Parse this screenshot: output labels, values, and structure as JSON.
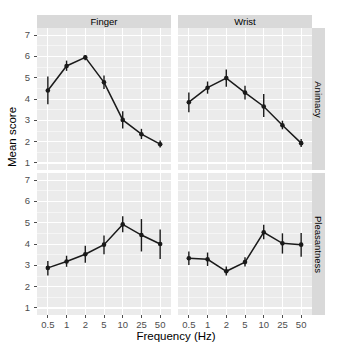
{
  "chart_data": {
    "type": "line",
    "title": "",
    "xlabel": "Frequency (Hz)",
    "ylabel": "Mean score",
    "ylim": [
      1,
      7
    ],
    "yticks": [
      1,
      2,
      3,
      4,
      5,
      6,
      7
    ],
    "x": [
      0.5,
      1,
      2,
      5,
      10,
      25,
      50
    ],
    "xtick_labels": [
      "0.5",
      "1",
      "2",
      "5",
      "10",
      "25",
      "50"
    ],
    "xscale": "log (evenly spaced categories)",
    "grid": true,
    "legend": "none",
    "facet_col_labels": [
      "Finger",
      "Wrist"
    ],
    "facet_row_labels": [
      "Animacy",
      "Pleasantness"
    ],
    "errorbars": "vertical, symmetric (95% CI)",
    "marker": "filled circle",
    "line_color": "#1a1a1a",
    "panel_bg": "#ebebeb",
    "strip_bg": "#d9d9d9",
    "grid_color": "#ffffff",
    "panels": [
      {
        "col": "Finger",
        "row": "Animacy",
        "values": [
          4.4,
          5.55,
          5.95,
          4.78,
          3.02,
          2.35,
          1.88
        ],
        "err_low": [
          3.75,
          5.32,
          5.82,
          4.47,
          2.62,
          2.12,
          1.72
        ],
        "err_high": [
          5.05,
          5.8,
          6.06,
          5.1,
          3.42,
          2.6,
          2.05
        ]
      },
      {
        "col": "Wrist",
        "row": "Animacy",
        "values": [
          3.85,
          4.53,
          4.98,
          4.3,
          3.65,
          2.77,
          1.93
        ],
        "err_low": [
          3.38,
          4.25,
          4.58,
          3.98,
          3.15,
          2.58,
          1.75
        ],
        "err_high": [
          4.3,
          4.82,
          5.38,
          4.62,
          4.23,
          2.98,
          2.12
        ]
      },
      {
        "col": "Finger",
        "row": "Pleasantness",
        "values": [
          2.88,
          3.18,
          3.52,
          3.97,
          4.92,
          4.42,
          4.0
        ],
        "err_low": [
          2.52,
          2.93,
          3.12,
          3.52,
          4.55,
          3.65,
          3.3
        ],
        "err_high": [
          3.2,
          3.45,
          3.92,
          4.4,
          5.3,
          5.17,
          4.68
        ]
      },
      {
        "col": "Wrist",
        "row": "Pleasantness",
        "values": [
          3.33,
          3.28,
          2.72,
          3.15,
          4.55,
          4.03,
          3.97
        ],
        "err_low": [
          3.02,
          2.97,
          2.52,
          2.95,
          4.22,
          3.55,
          3.4
        ],
        "err_high": [
          3.65,
          3.6,
          2.95,
          3.38,
          4.9,
          4.5,
          4.52
        ]
      }
    ]
  },
  "axes": {
    "y_title": "Mean score",
    "x_title": "Frequency (Hz)",
    "y_tick_labels": [
      "7",
      "6",
      "5",
      "4",
      "3",
      "2",
      "1"
    ],
    "x_tick_labels": [
      "0.5",
      "1",
      "2",
      "5",
      "10",
      "25",
      "50"
    ]
  },
  "strips": {
    "top": [
      "Finger",
      "Wrist"
    ],
    "right": [
      "Animacy",
      "Pleasantness"
    ]
  }
}
